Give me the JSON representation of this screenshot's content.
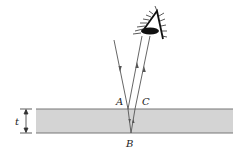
{
  "diagram": {
    "labels": {
      "A": "A",
      "B": "B",
      "C": "C",
      "thickness": "t"
    },
    "colors": {
      "film_fill": "#d4d4d4",
      "film_edge": "#777777",
      "ray": "#555555",
      "eye": "#111111",
      "text": "#222222"
    },
    "elements": [
      "eye",
      "incident-ray",
      "reflected-ray-A",
      "refracted-ray-AB",
      "refracted-ray-BC",
      "reflected-ray-C",
      "film-slab",
      "thickness-marker"
    ]
  }
}
